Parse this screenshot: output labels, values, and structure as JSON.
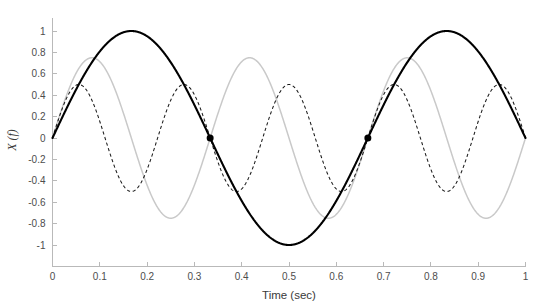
{
  "chart_data": {
    "type": "line",
    "title": "",
    "xlabel": "Time (sec)",
    "ylabel": "X (f)",
    "xlim": [
      0,
      1
    ],
    "ylim": [
      -1,
      1
    ],
    "grid": false,
    "legend": "none",
    "xticks": [
      "0",
      "0.1",
      "0.2",
      "0.3",
      "0.4",
      "0.5",
      "0.6",
      "0.7",
      "0.8",
      "0.9",
      "1"
    ],
    "xtick_values": [
      0,
      0.1,
      0.2,
      0.3,
      0.4,
      0.5,
      0.6,
      0.7,
      0.8,
      0.9,
      1
    ],
    "yticks": [
      "1",
      "0.8",
      "0.6",
      "0.4",
      "0.2",
      "0",
      "-0.2",
      "-0.4",
      "-0.6",
      "-0.8",
      "-1"
    ],
    "ytick_values": [
      1,
      0.8,
      0.6,
      0.4,
      0.2,
      0,
      -0.2,
      -0.4,
      -0.6,
      -0.8,
      -1
    ],
    "series": [
      {
        "name": "fundamental",
        "style": "solid",
        "color": "#000000",
        "amplitude": 1.0,
        "frequency_hz": 1.5,
        "phase": 0
      },
      {
        "name": "second-harmonic",
        "style": "solid",
        "color": "#c9c9c9",
        "amplitude": 0.75,
        "frequency_hz": 3.0,
        "phase": 0
      },
      {
        "name": "third-harmonic",
        "style": "dashed",
        "color": "#1a1a1a",
        "amplitude": 0.5,
        "frequency_hz": 4.5,
        "phase": 0
      }
    ],
    "markers": [
      {
        "x": 0.3333,
        "y": 0,
        "shape": "filled-circle",
        "color": "#000000",
        "size": 7
      },
      {
        "x": 0.6667,
        "y": 0,
        "shape": "filled-circle",
        "color": "#000000",
        "size": 7
      }
    ]
  },
  "axes": {
    "x_title": "Time (sec)",
    "y_title": "X (f)"
  }
}
